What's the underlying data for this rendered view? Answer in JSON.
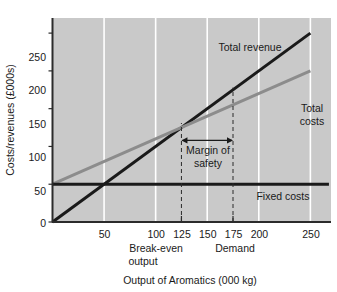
{
  "chart_data": {
    "type": "line",
    "title": "",
    "xlabel": "Output of Aromatics (000 kg)",
    "ylabel": "Costs/revenues (£000s)",
    "xlim": [
      0,
      270
    ],
    "ylim": [
      0,
      270
    ],
    "xticks": [
      50,
      100,
      125,
      150,
      175,
      200,
      250
    ],
    "xtick_labels": [
      "50",
      "100",
      "125",
      "150",
      "175",
      "200",
      "250"
    ],
    "yticks": [
      0,
      50,
      100,
      150,
      200,
      250
    ],
    "ytick_labels": [
      "0",
      "50",
      "100",
      "150",
      "200",
      "250"
    ],
    "gridlines": {
      "vertical_at": [
        50,
        100,
        150,
        200,
        250
      ],
      "color": "#ffffff",
      "horizontal": false
    },
    "plot_background": "#c9c9c9",
    "series": [
      {
        "name": "Total revenue",
        "label": "Total revenue",
        "color": "#1a1a1a",
        "width": 3,
        "points": [
          [
            0,
            0
          ],
          [
            250,
            250
          ]
        ],
        "label_x": 185,
        "label_y": 262
      },
      {
        "name": "Total costs",
        "label": "Total costs",
        "color": "#8c8c8c",
        "width": 3,
        "points": [
          [
            0,
            50
          ],
          [
            250,
            200
          ]
        ],
        "label_x": 258,
        "label_y": 192
      },
      {
        "name": "Fixed costs",
        "label": "Fixed costs",
        "color": "#1a1a1a",
        "width": 3,
        "points": [
          [
            0,
            50
          ],
          [
            268,
            50
          ]
        ],
        "label_x": 210,
        "label_y": 36
      }
    ],
    "markers": [
      {
        "name": "break-even-output",
        "label_line1": "Break-even",
        "label_line2": "output",
        "x": 125,
        "dashed_from_y": 0,
        "dashed_to_y": 131
      },
      {
        "name": "demand",
        "label_line1": "Demand",
        "label_line2": "",
        "x": 175,
        "dashed_from_y": 0,
        "dashed_to_y": 178
      }
    ],
    "annotations": [
      {
        "name": "margin-of-safety",
        "line1": "Margin of",
        "line2": "safety",
        "arrow_y": 108,
        "arrow_x_start": 125,
        "arrow_x_end": 175
      }
    ]
  },
  "labels": {
    "ylabel": "Costs/revenues (£000s)",
    "xlabel": "Output of Aromatics (000 kg)",
    "total_revenue": "Total revenue",
    "total_costs_line1": "Total",
    "total_costs_line2": "costs",
    "fixed_costs": "Fixed costs",
    "margin_line1": "Margin of",
    "margin_line2": "safety",
    "breakeven_line1": "Break-even",
    "breakeven_line2": "output",
    "demand": "Demand",
    "y0": "0",
    "y50": "50",
    "y100": "100",
    "y150": "150",
    "y200": "200",
    "y250": "250",
    "x50": "50",
    "x100": "100",
    "x125": "125",
    "x150": "150",
    "x175": "175",
    "x200": "200",
    "x250": "250"
  },
  "colors": {
    "plot_bg": "#c9c9c9",
    "page_bg": "#ffffff",
    "grid": "#ffffff",
    "revenue": "#1a1a1a",
    "costs": "#8c8c8c",
    "fixed": "#1a1a1a",
    "axis": "#2b2b2b",
    "text": "#1a1a1a"
  }
}
